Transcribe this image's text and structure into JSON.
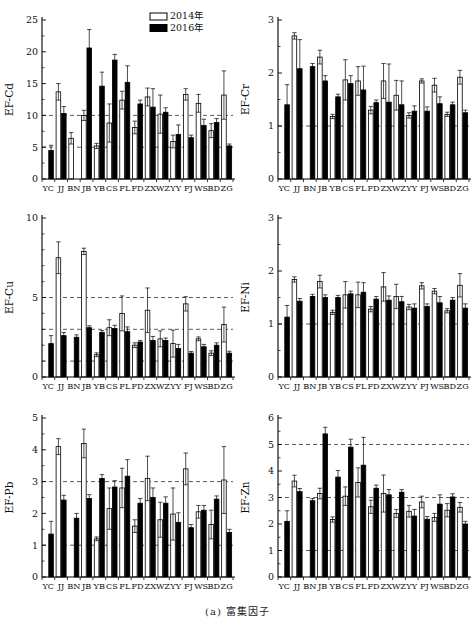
{
  "caption": "(a) 富集因子",
  "legend": {
    "position": "top-right-of-first-panel",
    "items": [
      {
        "label": "2014年",
        "fill": "#ffffff"
      },
      {
        "label": "2016年",
        "fill": "#000000"
      }
    ]
  },
  "colors": {
    "bar_2014": "#ffffff",
    "bar_2016": "#000000",
    "stroke": "#000000",
    "dash_line": "#333333"
  },
  "categories": [
    "YC",
    "JJ",
    "BN",
    "JB",
    "YB",
    "CS",
    "FL",
    "FD",
    "ZX",
    "WZ",
    "YY",
    "FJ",
    "WS",
    "BD",
    "ZG"
  ],
  "chart_data": [
    {
      "type": "bar",
      "title": "",
      "xlabel": "",
      "ylabel": "EF-Cd",
      "ylim": [
        0,
        25
      ],
      "yticks": [
        0,
        5,
        10,
        15,
        20,
        25
      ],
      "minor_step": 2.5,
      "dashed_lines": [
        5,
        10
      ],
      "grid": "dashed-thresholds",
      "legend_here": true,
      "categories": [
        "YC",
        "JJ",
        "BN",
        "JB",
        "YB",
        "CS",
        "FL",
        "FD",
        "ZX",
        "WZ",
        "YY",
        "FJ",
        "WS",
        "BD",
        "ZG"
      ],
      "series": [
        {
          "name": "2014年",
          "values": [
            0,
            13.7,
            6.4,
            10.0,
            5.2,
            8.8,
            12.4,
            8.1,
            12.9,
            10.2,
            5.9,
            13.3,
            11.9,
            7.6,
            13.2
          ],
          "errors": [
            0,
            1.3,
            0.9,
            0.8,
            0.4,
            3.0,
            1.4,
            1.0,
            1.4,
            3.0,
            1.0,
            0.9,
            1.4,
            1.1,
            3.8
          ]
        },
        {
          "name": "2016年",
          "values": [
            4.5,
            10.3,
            0,
            20.6,
            14.6,
            18.7,
            15.2,
            11.8,
            11.3,
            10.5,
            7.0,
            6.5,
            8.4,
            8.9,
            5.2
          ],
          "errors": [
            0.8,
            1.1,
            0,
            2.9,
            2.2,
            0.9,
            2.6,
            0.6,
            2.9,
            0.7,
            1.5,
            0.4,
            1.0,
            0.6,
            0.3
          ]
        }
      ]
    },
    {
      "type": "bar",
      "title": "",
      "xlabel": "",
      "ylabel": "EF-Cr",
      "ylim": [
        0,
        3
      ],
      "yticks": [
        0,
        1,
        2,
        3
      ],
      "minor_step": 0.5,
      "dashed_lines": [
        1
      ],
      "grid": "dashed-thresholds",
      "legend_here": false,
      "categories": [
        "YC",
        "JJ",
        "BN",
        "JB",
        "YB",
        "CS",
        "FL",
        "FD",
        "ZX",
        "WZ",
        "YY",
        "FJ",
        "WS",
        "BD",
        "ZG"
      ],
      "series": [
        {
          "name": "2014年",
          "values": [
            0,
            2.7,
            0,
            2.3,
            1.18,
            1.87,
            1.85,
            1.3,
            1.85,
            1.58,
            1.2,
            1.85,
            1.77,
            1.22,
            1.92
          ],
          "errors": [
            0,
            0.06,
            0,
            0.13,
            0.04,
            0.38,
            0.27,
            0.07,
            0.33,
            0.28,
            0.05,
            0.04,
            0.13,
            0.04,
            0.13
          ]
        },
        {
          "name": "2016年",
          "values": [
            1.4,
            2.08,
            2.12,
            1.85,
            1.55,
            1.8,
            1.68,
            1.44,
            1.45,
            1.4,
            1.28,
            1.28,
            1.42,
            1.4,
            1.25
          ],
          "errors": [
            0.38,
            0.55,
            0.06,
            0.1,
            0.05,
            0.15,
            0.45,
            0.05,
            0.72,
            0.45,
            0.1,
            0.08,
            0.13,
            0.05,
            0.05
          ]
        }
      ]
    },
    {
      "type": "bar",
      "title": "",
      "xlabel": "",
      "ylabel": "EF-Cu",
      "ylim": [
        0,
        10
      ],
      "yticks": [
        0,
        5,
        10
      ],
      "minor_step": 1,
      "dashed_lines": [
        1,
        3,
        5
      ],
      "grid": "dashed-thresholds",
      "legend_here": false,
      "categories": [
        "YC",
        "JJ",
        "BN",
        "JB",
        "YB",
        "CS",
        "FL",
        "FD",
        "ZX",
        "WZ",
        "YY",
        "FJ",
        "WS",
        "BD",
        "ZG"
      ],
      "series": [
        {
          "name": "2014年",
          "values": [
            0,
            7.5,
            0,
            7.9,
            1.4,
            3.1,
            4.0,
            2.0,
            4.2,
            2.4,
            2.1,
            4.6,
            2.4,
            1.5,
            3.3
          ],
          "errors": [
            0,
            1.0,
            0,
            0.2,
            0.12,
            0.5,
            1.1,
            0.15,
            1.4,
            0.5,
            0.85,
            0.45,
            0.12,
            0.15,
            1.1
          ]
        },
        {
          "name": "2016年",
          "values": [
            2.1,
            2.6,
            2.5,
            3.1,
            2.8,
            3.05,
            2.85,
            2.2,
            2.3,
            2.3,
            1.8,
            1.5,
            1.9,
            2.0,
            1.5
          ],
          "errors": [
            0.5,
            0.2,
            0.15,
            0.12,
            0.12,
            0.2,
            0.3,
            0.1,
            0.25,
            0.15,
            0.25,
            0.1,
            0.15,
            0.15,
            0.12
          ]
        }
      ]
    },
    {
      "type": "bar",
      "title": "",
      "xlabel": "",
      "ylabel": "EF-Ni",
      "ylim": [
        0,
        3
      ],
      "yticks": [
        0,
        1,
        2,
        3
      ],
      "minor_step": 0.5,
      "dashed_lines": [
        1
      ],
      "grid": "dashed-thresholds",
      "legend_here": false,
      "categories": [
        "YC",
        "JJ",
        "BN",
        "JB",
        "YB",
        "CS",
        "FL",
        "FD",
        "ZX",
        "WZ",
        "YY",
        "FJ",
        "WS",
        "BD",
        "ZG"
      ],
      "series": [
        {
          "name": "2014年",
          "values": [
            0,
            1.84,
            0,
            1.8,
            1.22,
            1.55,
            1.55,
            1.28,
            1.7,
            1.52,
            1.32,
            1.72,
            1.62,
            1.25,
            1.73
          ],
          "errors": [
            0,
            0.05,
            0,
            0.12,
            0.04,
            0.25,
            0.24,
            0.05,
            0.27,
            0.23,
            0.05,
            0.06,
            0.05,
            0.04,
            0.22
          ]
        },
        {
          "name": "2016年",
          "values": [
            1.13,
            1.43,
            1.52,
            1.5,
            1.5,
            1.57,
            1.6,
            1.47,
            1.45,
            1.42,
            1.3,
            1.33,
            1.4,
            1.45,
            1.3
          ],
          "errors": [
            0.22,
            0.05,
            0.04,
            0.05,
            0.04,
            0.05,
            0.18,
            0.05,
            0.08,
            0.1,
            0.08,
            0.05,
            0.12,
            0.05,
            0.08
          ]
        }
      ]
    },
    {
      "type": "bar",
      "title": "",
      "xlabel": "",
      "ylabel": "EF-Pb",
      "ylim": [
        0,
        5
      ],
      "yticks": [
        0,
        1,
        2,
        3,
        4,
        5
      ],
      "minor_step": 0.5,
      "dashed_lines": [
        1,
        3
      ],
      "grid": "dashed-thresholds",
      "legend_here": false,
      "categories": [
        "YC",
        "JJ",
        "BN",
        "JB",
        "YB",
        "CS",
        "FL",
        "FD",
        "ZX",
        "WZ",
        "YY",
        "FJ",
        "WS",
        "BD",
        "ZG"
      ],
      "series": [
        {
          "name": "2014年",
          "values": [
            0,
            4.1,
            0,
            4.2,
            1.2,
            2.15,
            2.8,
            1.6,
            3.1,
            1.8,
            1.98,
            3.4,
            2.05,
            1.65,
            3.05
          ],
          "errors": [
            0,
            0.25,
            0,
            0.45,
            0.06,
            0.65,
            0.62,
            0.2,
            0.7,
            0.55,
            0.82,
            0.5,
            0.2,
            0.45,
            1.05
          ]
        },
        {
          "name": "2016年",
          "values": [
            1.35,
            2.42,
            1.85,
            2.47,
            3.1,
            2.83,
            3.17,
            2.32,
            2.5,
            2.32,
            1.72,
            1.55,
            2.1,
            2.45,
            1.4
          ],
          "errors": [
            0.4,
            0.15,
            0.15,
            0.12,
            0.12,
            0.2,
            0.52,
            0.15,
            0.3,
            0.2,
            0.3,
            0.1,
            0.15,
            0.1,
            0.1
          ]
        }
      ]
    },
    {
      "type": "bar",
      "title": "",
      "xlabel": "",
      "ylabel": "EF-Zn",
      "ylim": [
        0,
        6
      ],
      "yticks": [
        0,
        1,
        2,
        3,
        4,
        5,
        6
      ],
      "minor_step": 0.5,
      "dashed_lines": [
        1,
        3,
        5
      ],
      "grid": "dashed-thresholds",
      "legend_here": false,
      "categories": [
        "YC",
        "JJ",
        "BN",
        "JB",
        "YB",
        "CS",
        "FL",
        "FD",
        "ZX",
        "WZ",
        "YY",
        "FJ",
        "WS",
        "BD",
        "ZG"
      ],
      "series": [
        {
          "name": "2014年",
          "values": [
            0,
            3.62,
            0,
            3.15,
            2.17,
            3.05,
            3.57,
            2.65,
            3.15,
            2.4,
            2.48,
            2.83,
            2.25,
            2.52,
            2.63
          ],
          "errors": [
            0,
            0.22,
            0,
            0.2,
            0.1,
            0.35,
            0.55,
            0.25,
            0.7,
            0.15,
            0.22,
            0.22,
            0.15,
            0.25,
            0.18
          ]
        },
        {
          "name": "2016年",
          "values": [
            2.1,
            3.22,
            2.88,
            5.4,
            3.77,
            4.9,
            4.22,
            3.35,
            3.1,
            3.2,
            2.3,
            2.18,
            2.75,
            3.02,
            2.0
          ],
          "errors": [
            0.4,
            0.12,
            0.08,
            0.25,
            0.25,
            0.3,
            1.05,
            0.12,
            0.2,
            0.1,
            0.25,
            0.1,
            0.35,
            0.12,
            0.1
          ]
        }
      ]
    }
  ]
}
